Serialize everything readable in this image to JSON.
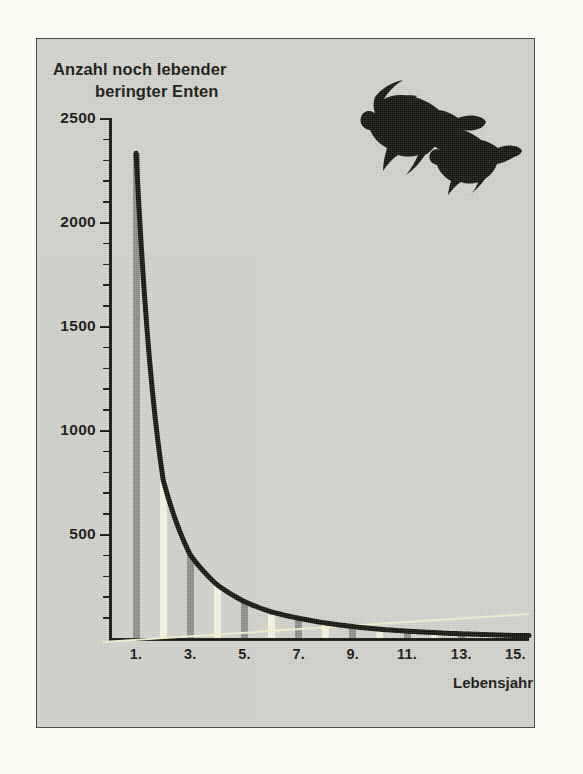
{
  "figure": {
    "title_line1": "Anzahl noch lebender",
    "title_line2": "beringter Enten",
    "illustration": "flying-ducks-silhouette",
    "background_color": "#d2d2cd",
    "curve_color": "#15150f",
    "bar_dark_color": "#8f8f8a",
    "bar_light_color": "#f6f4df",
    "guide_line_color": "#f2efcf"
  },
  "chart_data": {
    "type": "line",
    "title": "Anzahl noch lebender beringter Enten",
    "xlabel": "Lebensjahr",
    "ylabel": "Anzahl noch lebender beringter Enten",
    "xlim": [
      0,
      15.5
    ],
    "ylim": [
      0,
      2500
    ],
    "grid": false,
    "legend": null,
    "y_ticks_major": [
      0,
      500,
      1000,
      1500,
      2000,
      2500
    ],
    "y_tick_labels": [
      "",
      "500",
      "1000",
      "1500",
      "2000",
      "2500"
    ],
    "y_tick_minor_step": 100,
    "x_ticks": [
      1,
      3,
      5,
      7,
      9,
      11,
      13,
      15
    ],
    "x_tick_labels": [
      "1.",
      "3.",
      "5.",
      "7.",
      "9.",
      "11.",
      "13.",
      "15."
    ],
    "x": [
      1,
      2,
      3,
      4,
      5,
      6,
      7,
      8,
      9,
      10,
      11,
      12,
      13,
      14,
      15
    ],
    "values": [
      2330,
      760,
      400,
      255,
      175,
      125,
      95,
      72,
      55,
      42,
      33,
      26,
      20,
      16,
      12
    ],
    "series": [
      {
        "name": "Anzahl noch lebender beringter Enten",
        "values": [
          2330,
          760,
          400,
          255,
          175,
          125,
          95,
          72,
          55,
          42,
          33,
          26,
          20,
          16,
          12
        ]
      }
    ],
    "bar_style_sequence": [
      "dark",
      "light",
      "dark",
      "light",
      "dark",
      "light",
      "dark",
      "light",
      "dark",
      "light",
      "dark",
      "light",
      "dark",
      "light",
      "dark"
    ],
    "annotations": []
  }
}
